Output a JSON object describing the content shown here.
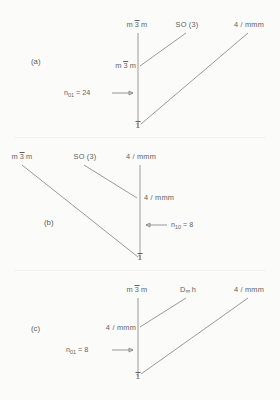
{
  "figure": {
    "background": "#fbfbfa",
    "line_color": "#8e8e8e",
    "text_color": "#5f5f5f",
    "panel_count": 3
  },
  "panels": [
    {
      "tag": "(a)",
      "top_labels": [
        {
          "name": "m-3bar-m",
          "pre": "m",
          "bar": "3",
          "post": "m"
        },
        {
          "name": "so-3",
          "text": "SO (3)"
        },
        {
          "name": "4-mmm",
          "text": "4 / mmm"
        }
      ],
      "nodes": [
        {
          "name": "top-node",
          "pre": "m",
          "bar": "3",
          "post": "m"
        },
        {
          "name": "middle-node",
          "pre": "m",
          "bar": "3",
          "post": "m"
        },
        {
          "name": "bottom-node",
          "bar": "1"
        }
      ],
      "annotation": {
        "symbol": "n",
        "subscript": "01",
        "equals": "= 24",
        "arrow": "⟶",
        "arrow_direction": "right"
      }
    },
    {
      "tag": "(b)",
      "top_labels": [
        {
          "name": "m-3bar-m",
          "pre": "m",
          "bar": "3",
          "post": "m"
        },
        {
          "name": "so-3",
          "text": "SO (3)"
        },
        {
          "name": "4-mmm",
          "text": "4 / mmm"
        }
      ],
      "nodes": [
        {
          "name": "top-node",
          "text": "4 / mmm"
        },
        {
          "name": "middle-node",
          "text": "4 / mmm"
        },
        {
          "name": "bottom-node",
          "bar": "1"
        }
      ],
      "annotation": {
        "symbol": "n",
        "subscript": "10",
        "equals": "= 8",
        "arrow": "⟵",
        "arrow_direction": "left"
      }
    },
    {
      "tag": "(c)",
      "top_labels": [
        {
          "name": "m-3bar-m",
          "pre": "m",
          "bar": "3",
          "post": "m"
        },
        {
          "name": "d-infinity-h",
          "pre": "D",
          "infinity": "∞",
          "post": "h"
        },
        {
          "name": "4-mmm",
          "text": "4 / mmm"
        }
      ],
      "nodes": [
        {
          "name": "top-node",
          "pre": "m",
          "bar": "3",
          "post": "m"
        },
        {
          "name": "middle-node",
          "text": "4 / mmm"
        },
        {
          "name": "bottom-node",
          "bar": "1"
        }
      ],
      "annotation": {
        "symbol": "n",
        "subscript": "01",
        "equals": "= 8",
        "arrow": "⟶",
        "arrow_direction": "right"
      }
    }
  ]
}
